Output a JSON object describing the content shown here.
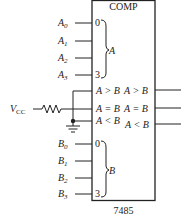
{
  "chip": {
    "title": "COMP",
    "part_number": "7485"
  },
  "inputs_a": {
    "group_label": "A",
    "pins": [
      {
        "name": "A",
        "sub": "0",
        "index": "0"
      },
      {
        "name": "A",
        "sub": "1",
        "index": ""
      },
      {
        "name": "A",
        "sub": "2",
        "index": ""
      },
      {
        "name": "A",
        "sub": "3",
        "index": "3"
      }
    ]
  },
  "inputs_b": {
    "group_label": "B",
    "pins": [
      {
        "name": "B",
        "sub": "0",
        "index": "0"
      },
      {
        "name": "B",
        "sub": "1",
        "index": ""
      },
      {
        "name": "B",
        "sub": "2",
        "index": ""
      },
      {
        "name": "B",
        "sub": "3",
        "index": "3"
      }
    ]
  },
  "cascade_inputs": [
    "A > B",
    "A = B",
    "A < B"
  ],
  "outputs": [
    "A > B",
    "A = B",
    "A < B"
  ],
  "supply": {
    "name": "V",
    "sub": "CC"
  }
}
